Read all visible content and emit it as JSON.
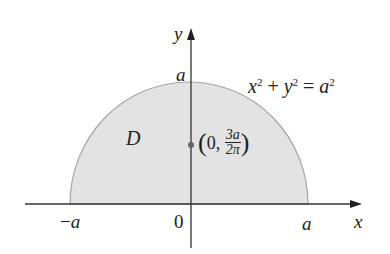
{
  "diagram": {
    "region_label": "D",
    "equation": {
      "x": "x",
      "y": "y",
      "a": "a",
      "exp": "2",
      "plus": "+",
      "eq": "="
    },
    "axes": {
      "x_label": "x",
      "y_label": "y"
    },
    "ticks": {
      "neg_a": "−a",
      "origin": "0",
      "pos_a": "a",
      "top_a": "a"
    },
    "centroid": {
      "open": "(",
      "zero": "0,",
      "num": "3a",
      "den": "2π",
      "close": ")"
    },
    "colors": {
      "fill": "#e2e2e2",
      "edge": "#9a9a9a",
      "axis": "#333333",
      "dot": "#666666"
    }
  }
}
